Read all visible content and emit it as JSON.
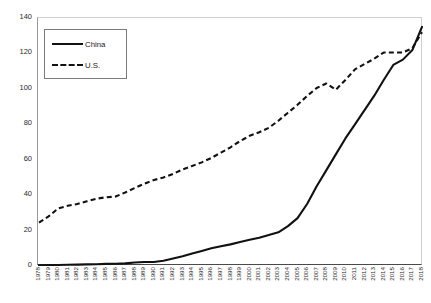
{
  "chart_data": {
    "type": "line",
    "title": "",
    "xlabel": "",
    "ylabel": "",
    "ylim": [
      0,
      140
    ],
    "yticks": [
      0,
      20,
      40,
      60,
      80,
      100,
      120,
      140
    ],
    "grid": false,
    "legend_position": "top-left",
    "categories": [
      "1978",
      "1979",
      "1980",
      "1981",
      "1982",
      "1983",
      "1984",
      "1985",
      "1986",
      "1987",
      "1988",
      "1989",
      "1990",
      "1991",
      "1992",
      "1993",
      "1994",
      "1995",
      "1996",
      "1997",
      "1998",
      "1999",
      "2000",
      "2001",
      "2002",
      "2003",
      "2004",
      "2005",
      "2006",
      "2007",
      "2008",
      "2009",
      "2010",
      "2011",
      "2012",
      "2013",
      "2014",
      "2015",
      "2016",
      "2017",
      "2018"
    ],
    "series": [
      {
        "name": "China",
        "style": "solid",
        "color": "#111111",
        "values": [
          0.4,
          0.5,
          0.6,
          0.7,
          0.8,
          0.9,
          1.0,
          1.2,
          1.3,
          1.5,
          2.0,
          2.3,
          2.3,
          3.0,
          4.2,
          5.5,
          7.0,
          8.5,
          10.0,
          11.2,
          12.2,
          13.5,
          14.8,
          16.0,
          17.5,
          19.0,
          22.5,
          27.0,
          35.0,
          45.0,
          54.0,
          63.0,
          72.0,
          80.0,
          88.0,
          96.0,
          105.0,
          113.5,
          116.5,
          122.0,
          135.0
        ]
      },
      {
        "name": "U.S.",
        "style": "dashed",
        "color": "#111111",
        "values": [
          24.5,
          28.0,
          32.5,
          34.0,
          35.0,
          36.5,
          38.0,
          38.8,
          39.2,
          41.5,
          44.0,
          46.5,
          48.5,
          50.0,
          52.0,
          54.5,
          56.5,
          58.5,
          61.0,
          64.0,
          67.0,
          70.5,
          73.5,
          75.5,
          78.0,
          82.0,
          86.5,
          91.0,
          96.0,
          100.5,
          103.0,
          99.5,
          105.0,
          111.0,
          114.0,
          117.0,
          120.5,
          120.5,
          120.5,
          123.0,
          132.0
        ]
      }
    ]
  },
  "legend": {
    "entries": [
      {
        "label": "China",
        "key": "solid-line-key"
      },
      {
        "label": "U.S.",
        "key": "dashed-line-key"
      }
    ]
  },
  "axes": {
    "y_labels": [
      "140",
      "120",
      "100",
      "80",
      "60",
      "40",
      "20",
      "0"
    ]
  }
}
